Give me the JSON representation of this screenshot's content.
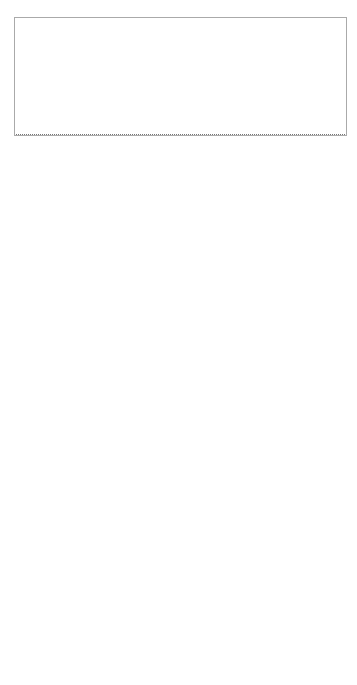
{
  "architecture": {
    "project_label": "GAMBAS Project",
    "middleware_label": "GAMBAS Middleware",
    "components_label": "GAMBAS Components",
    "prototype_application": "Prototype Application",
    "enables_label": "Enables",
    "validates_label": "Validates",
    "components": [
      {
        "number": "4",
        "label_lines": [
          "Interoperable",
          "Data Modelling",
          "and Processing"
        ]
      },
      {
        "number": "5",
        "label_lines": [
          "Automated Privacy-",
          "Preservation"
        ]
      },
      {
        "number": "3",
        "label_lines": [
          "Intent-aware User",
          "Interfaces"
        ]
      },
      {
        "number": "1",
        "label_lines": [
          "Adaptive Data",
          "Acquisition"
        ]
      }
    ],
    "service_discovery": {
      "number": "2",
      "label_lines": [
        "Service Discovery",
        "and Communication Middleware"
      ]
    }
  },
  "gambas_flow": {
    "logo_text": "GAMBAS",
    "badges": [
      "1",
      "2",
      "3",
      "4",
      "5"
    ],
    "use_service_label": "Use Service",
    "aggregate_context_lines": [
      "Aggregate",
      "Context"
    ],
    "steps": [
      "Recognize Context",
      "Discover Services",
      "Recommend Services",
      "Pick Service",
      "Query Context",
      "Enforce Privacy",
      "Share Context",
      "Get Result"
    ]
  },
  "mobile_app": {
    "row_label": "Mobile App",
    "group1_label": "Search App",
    "group2_label": "Use App",
    "steps": [
      [
        "Open",
        "Market"
      ],
      [
        "Enter",
        "Term"
      ],
      [
        "Pick",
        "App"
      ],
      [
        "Enter",
        "Data"
      ],
      [
        "Enter",
        "Data"
      ],
      [
        "Get",
        "Result"
      ]
    ],
    "ellipsis": "..."
  },
  "mobile_web": {
    "row_label": "Mobile Web",
    "group1_label": "Search Website",
    "group2_label": "Use Website",
    "steps": [
      [
        "Open",
        "Browser"
      ],
      [
        "Enter",
        "Term"
      ],
      [
        "Pick",
        "Page"
      ],
      [
        "Click",
        "Link"
      ],
      [
        "Enter",
        "Data"
      ],
      [
        "Get",
        "Result"
      ]
    ],
    "ellipsis": "..."
  },
  "colors": {
    "badge": "#111111",
    "line": "#333333",
    "border": "#555555",
    "logo": "#8a8a8a"
  }
}
